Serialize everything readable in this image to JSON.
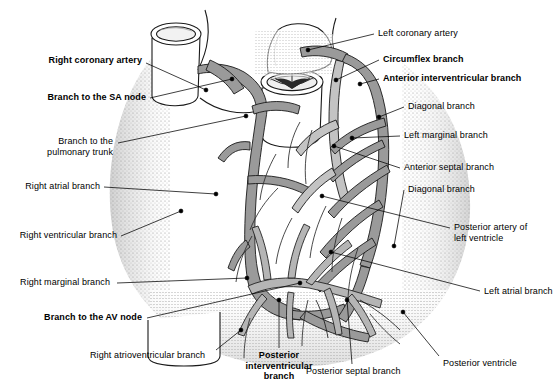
{
  "figure": {
    "view": "anterior and posterior coronary circulation",
    "background_color": "#ffffff",
    "artery_fill_color": "#9a9a9a",
    "artery_fill_light": "#c3c3c3",
    "outline_color": "#1a1a1a",
    "stipple_color": "#808080",
    "label_color": "#000000"
  },
  "labels": [
    {
      "id": "right-coronary-artery",
      "text": "Right coronary artery",
      "bold": true,
      "align": "right",
      "x": 142,
      "y": 55,
      "leader": [
        [
          146,
          63
        ],
        [
          206,
          90
        ]
      ],
      "dot": [
        206,
        90
      ]
    },
    {
      "id": "branch-sa-node",
      "text": "Branch to the SA node",
      "bold": true,
      "align": "right",
      "x": 146,
      "y": 92,
      "leader": [
        [
          150,
          98
        ],
        [
          232,
          79
        ]
      ],
      "dot": [
        232,
        79
      ]
    },
    {
      "id": "branch-pulmonary-trunk",
      "text": "Branch to the\npulmonary trunk",
      "bold": false,
      "align": "right",
      "x": 113,
      "y": 136,
      "leader": [
        [
          118,
          143
        ],
        [
          246,
          116
        ]
      ],
      "dot": [
        246,
        116
      ]
    },
    {
      "id": "right-atrial-branch",
      "text": "Right atrial branch",
      "bold": false,
      "align": "right",
      "x": 100,
      "y": 181,
      "leader": [
        [
          104,
          187
        ],
        [
          216,
          194
        ]
      ],
      "dot": [
        216,
        194
      ]
    },
    {
      "id": "right-ventricular-branch",
      "text": "Right ventricular branch",
      "bold": false,
      "align": "right",
      "x": 117,
      "y": 230,
      "leader": [
        [
          121,
          236
        ],
        [
          181,
          211
        ]
      ],
      "dot": [
        181,
        211
      ]
    },
    {
      "id": "right-marginal-branch",
      "text": "Right marginal branch",
      "bold": false,
      "align": "right",
      "x": 110,
      "y": 277,
      "leader": [
        [
          117,
          283
        ],
        [
          247,
          278
        ]
      ],
      "dot": [
        247,
        278
      ]
    },
    {
      "id": "branch-av-node",
      "text": "Branch to the AV node",
      "bold": true,
      "align": "right",
      "x": 142,
      "y": 312,
      "leader": [
        [
          147,
          318
        ],
        [
          300,
          283
        ]
      ],
      "dot": [
        300,
        283
      ]
    },
    {
      "id": "right-atrioventricular-branch",
      "text": "Right atrioventricular branch",
      "bold": false,
      "align": "left",
      "x": 90,
      "y": 350,
      "leader": [
        [
          216,
          350
        ],
        [
          241,
          330
        ]
      ],
      "dot": [
        241,
        330
      ]
    },
    {
      "id": "posterior-interventricular-branch",
      "text": "Posterior\ninterventricular\nbranch",
      "bold": true,
      "align": "center",
      "x": 232,
      "y": 350,
      "leader": [
        [
          279,
          348
        ],
        [
          279,
          300
        ]
      ],
      "dot": [
        279,
        300
      ]
    },
    {
      "id": "posterior-septal-branch",
      "text": "Posterior septal branch",
      "bold": false,
      "align": "left",
      "x": 306,
      "y": 366,
      "leader": [
        [
          352,
          364
        ],
        [
          347,
          300
        ]
      ],
      "dot": [
        347,
        300
      ]
    },
    {
      "id": "left-coronary-artery",
      "text": "Left coronary artery",
      "bold": false,
      "align": "left",
      "x": 378,
      "y": 28,
      "leader": [
        [
          374,
          34
        ],
        [
          308,
          50
        ]
      ],
      "dot": [
        308,
        50
      ]
    },
    {
      "id": "circumflex-branch",
      "text": "Circumflex branch",
      "bold": true,
      "align": "left",
      "x": 383,
      "y": 54,
      "leader": [
        [
          379,
          60
        ],
        [
          336,
          80
        ]
      ],
      "dot": [
        336,
        80
      ]
    },
    {
      "id": "anterior-interventricular-branch",
      "text": "Anterior interventricular branch",
      "bold": true,
      "align": "left",
      "x": 383,
      "y": 73,
      "leader": [
        [
          379,
          79
        ],
        [
          360,
          84
        ]
      ],
      "dot": [
        360,
        84
      ]
    },
    {
      "id": "diagonal-branch-upper",
      "text": "Diagonal branch",
      "bold": false,
      "align": "left",
      "x": 408,
      "y": 101,
      "leader": [
        [
          404,
          107
        ],
        [
          379,
          117
        ]
      ],
      "dot": [
        379,
        117
      ]
    },
    {
      "id": "left-marginal-branch",
      "text": "Left marginal branch",
      "bold": false,
      "align": "left",
      "x": 404,
      "y": 130,
      "leader": [
        [
          400,
          136
        ],
        [
          352,
          138
        ]
      ],
      "dot": [
        352,
        138
      ]
    },
    {
      "id": "anterior-septal-branch",
      "text": "Anterior septal branch",
      "bold": false,
      "align": "left",
      "x": 404,
      "y": 162,
      "leader": [
        [
          400,
          168
        ],
        [
          334,
          146
        ]
      ],
      "dot": [
        334,
        146
      ]
    },
    {
      "id": "diagonal-branch-lower",
      "text": "Diagonal branch",
      "bold": false,
      "align": "left",
      "x": 408,
      "y": 184,
      "leader": [
        [
          404,
          190
        ],
        [
          394,
          246
        ]
      ],
      "dot": [
        394,
        246
      ]
    },
    {
      "id": "posterior-artery-left-ventricle",
      "text": "Posterior artery of\nleft ventricle",
      "bold": false,
      "align": "left",
      "x": 454,
      "y": 222,
      "leader": [
        [
          450,
          228
        ],
        [
          322,
          196
        ]
      ],
      "dot": [
        322,
        196
      ]
    },
    {
      "id": "left-atrial-branch",
      "text": "Left atrial branch",
      "bold": false,
      "align": "left",
      "x": 484,
      "y": 286,
      "leader": [
        [
          480,
          291
        ],
        [
          331,
          252
        ]
      ],
      "dot": [
        331,
        252
      ]
    },
    {
      "id": "posterior-ventricle",
      "text": "Posterior ventricle",
      "bold": false,
      "align": "left",
      "x": 443,
      "y": 358,
      "leader": [
        [
          439,
          356
        ],
        [
          403,
          312
        ]
      ],
      "dot": [
        403,
        312
      ]
    }
  ]
}
